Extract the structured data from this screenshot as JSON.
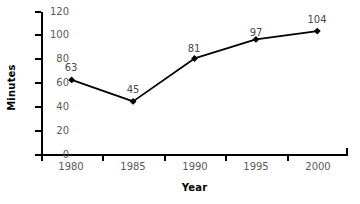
{
  "chart_data": {
    "type": "line",
    "title": "",
    "xlabel": "Year",
    "ylabel": "Minutes",
    "categories": [
      "1980",
      "1985",
      "1990",
      "1995",
      "2000"
    ],
    "values": [
      63,
      45,
      81,
      97,
      104
    ],
    "point_labels": [
      "63",
      "45",
      "81",
      "97",
      "104"
    ],
    "ylim": [
      0,
      120
    ],
    "yticks": [
      0,
      20,
      40,
      60,
      80,
      100,
      120
    ],
    "ytick_labels": [
      "0",
      "20",
      "40",
      "60",
      "80",
      "100",
      "120"
    ],
    "xtick_labels": [
      "1980",
      "1985",
      "1990",
      "1995",
      "2000"
    ],
    "grid": false,
    "legend": false,
    "marker": "diamond",
    "line_color": "#000000",
    "marker_color": "#000000",
    "label_color": "#4a4a4a",
    "tick_label_color": "#5a5a5a",
    "axis_color": "#000000",
    "background_color": "#ffffff"
  }
}
